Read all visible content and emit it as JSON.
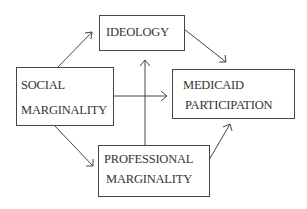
{
  "diagram": {
    "type": "path-diagram",
    "nodes": [
      {
        "id": "ideology",
        "lines": [
          "IDEOLOGY"
        ]
      },
      {
        "id": "social",
        "lines": [
          "SOCIAL",
          "MARGINALITY"
        ]
      },
      {
        "id": "medicaid",
        "lines": [
          "MEDICAID",
          "PARTICIPATION"
        ]
      },
      {
        "id": "professional",
        "lines": [
          "PROFESSIONAL",
          "MARGINALITY"
        ]
      }
    ],
    "edges": [
      {
        "from": "social",
        "to": "ideology"
      },
      {
        "from": "social",
        "to": "medicaid"
      },
      {
        "from": "social",
        "to": "professional"
      },
      {
        "from": "ideology",
        "to": "medicaid"
      },
      {
        "from": "professional",
        "to": "ideology"
      },
      {
        "from": "professional",
        "to": "medicaid"
      }
    ],
    "colors": {
      "line": "#444444",
      "text": "#333333",
      "background": "#ffffff"
    }
  }
}
